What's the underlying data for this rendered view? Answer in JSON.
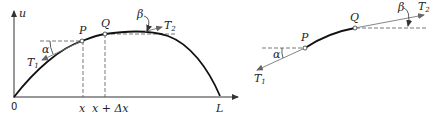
{
  "figure": {
    "left_panel": {
      "axis_y_label": "u",
      "origin_label": "0",
      "x_ticks": [
        "x",
        "x + Δx"
      ],
      "end_label": "L",
      "points": [
        {
          "name": "P",
          "x": 82,
          "y": 41
        },
        {
          "name": "Q",
          "x": 105,
          "y": 34
        }
      ],
      "angles": {
        "alpha": "α",
        "beta": "β"
      },
      "forces": {
        "T1": {
          "base": "T",
          "sub": "1"
        },
        "T2": {
          "base": "T",
          "sub": "2"
        }
      }
    },
    "right_panel": {
      "points": [
        {
          "name": "P",
          "x": 305,
          "y": 48
        },
        {
          "name": "Q",
          "x": 355,
          "y": 28
        }
      ],
      "angles": {
        "alpha": "α",
        "beta": "β"
      },
      "forces": {
        "T1": {
          "base": "T",
          "sub": "1"
        },
        "T2": {
          "base": "T",
          "sub": "2"
        }
      }
    },
    "colors": {
      "curve": "#111111",
      "axis": "#333333",
      "dashed": "#555555",
      "arrow": "#777777"
    }
  }
}
